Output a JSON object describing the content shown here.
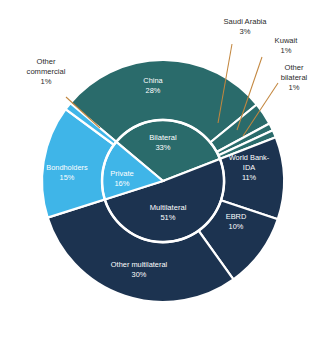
{
  "chart_data": {
    "type": "pie",
    "title": "",
    "subtitle": "",
    "xlabel": "",
    "ylabel": "",
    "legend_position": "none",
    "grid": false,
    "units": "percent",
    "rings": [
      {
        "name": "inner",
        "radius_fraction": 0.5,
        "categories": [
          "Bilateral",
          "Multilateral",
          "Private"
        ],
        "values": [
          33,
          51,
          16
        ],
        "labels": [
          {
            "name": "Bilateral",
            "value": 33,
            "value_text": "33%"
          },
          {
            "name": "Multilateral",
            "value": 51,
            "value_text": "51%"
          },
          {
            "name": "Private",
            "value": 16,
            "value_text": "16%"
          }
        ]
      },
      {
        "name": "outer",
        "radius_fraction": 1.0,
        "categories": [
          "China",
          "Saudi Arabia",
          "Kuwait",
          "Other bilateral",
          "World Bank-IDA",
          "EBRD",
          "Other multilateral",
          "Bondholders",
          "Other commercial"
        ],
        "values": [
          28,
          3,
          1,
          1,
          11,
          10,
          30,
          15,
          1
        ],
        "labels": [
          {
            "name": "China",
            "value": 28,
            "value_text": "28%",
            "placement": "inside"
          },
          {
            "name": "Saudi Arabia",
            "value": 3,
            "value_text": "3%",
            "placement": "outside"
          },
          {
            "name": "Kuwait",
            "value": 1,
            "value_text": "1%",
            "placement": "outside"
          },
          {
            "name": "Other bilateral",
            "value": 1,
            "value_text": "1%",
            "placement": "outside"
          },
          {
            "name": "World Bank-IDA",
            "value": 11,
            "value_text": "11%",
            "placement": "inside"
          },
          {
            "name": "EBRD",
            "value": 10,
            "value_text": "10%",
            "placement": "inside"
          },
          {
            "name": "Other multilateral",
            "value": 30,
            "value_text": "30%",
            "placement": "inside"
          },
          {
            "name": "Bondholders",
            "value": 15,
            "value_text": "15%",
            "placement": "inside"
          },
          {
            "name": "Other commercial",
            "value": 1,
            "value_text": "1%",
            "placement": "outside"
          }
        ]
      }
    ]
  },
  "colors": {
    "bilateral_teal": "#2a6b6b",
    "multilateral_navy": "#1c3350",
    "private_lightblue": "#3fb5e8",
    "separator": "#ffffff",
    "leader_line": "#c3873f",
    "outside_label_text": "#2b2b2b",
    "inside_label_text": "#ffffff",
    "background": "#ffffff"
  },
  "labels": {
    "inner": {
      "bilateral_name": "Bilateral",
      "bilateral_value": "33%",
      "multilateral_name": "Multilateral",
      "multilateral_value": "51%",
      "private_name": "Private",
      "private_value": "16%"
    },
    "outer_inside": {
      "china_name": "China",
      "china_value": "28%",
      "worldbank_name_line1": "World Bank-",
      "worldbank_name_line2": "IDA",
      "worldbank_value": "11%",
      "ebrd_name": "EBRD",
      "ebrd_value": "10%",
      "other_multilateral_name": "Other multilateral",
      "other_multilateral_value": "30%",
      "bondholders_name": "Bondholders",
      "bondholders_value": "15%"
    },
    "outer_callouts": {
      "saudi_name": "Saudi Arabia",
      "saudi_value": "3%",
      "kuwait_name": "Kuwait",
      "kuwait_value": "1%",
      "other_bilateral_line1": "Other",
      "other_bilateral_line2": "bilateral",
      "other_bilateral_value": "1%",
      "other_commercial_line1": "Other",
      "other_commercial_line2": "commercial",
      "other_commercial_value": "1%"
    }
  }
}
